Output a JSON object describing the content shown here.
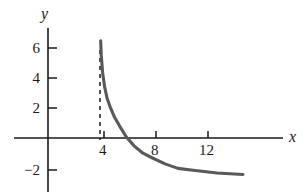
{
  "chart_data": {
    "type": "line",
    "title": "",
    "xlabel": "x",
    "ylabel": "y",
    "xlim": [
      -1,
      16.5
    ],
    "ylim": [
      -3.2,
      7.2
    ],
    "grid": false,
    "legend": null,
    "x_ticks": [
      {
        "value": 4,
        "label": "4"
      },
      {
        "value": 8,
        "label": "8"
      },
      {
        "value": 12,
        "label": "12"
      }
    ],
    "y_ticks": [
      {
        "value": 6,
        "label": "6"
      },
      {
        "value": 4,
        "label": "4"
      },
      {
        "value": 2,
        "label": "2"
      },
      {
        "value": -2,
        "label": "−2"
      }
    ],
    "annotations": [
      {
        "kind": "vertical-asymptote",
        "x": 4,
        "style": "dashed",
        "label": "x = 4"
      }
    ],
    "series": [
      {
        "name": "curve",
        "color": "#595959",
        "style": "solid",
        "x": [
          4.05,
          4.1,
          4.2,
          4.35,
          4.55,
          4.8,
          5.1,
          5.5,
          6.0,
          6.6,
          7.3,
          8.0,
          9.0,
          10.0,
          11.0,
          12.0,
          13.0,
          14.0,
          15.0
        ],
        "y": [
          6.4,
          5.4,
          4.3,
          3.4,
          2.6,
          2.0,
          1.4,
          0.8,
          0.1,
          -0.5,
          -1.0,
          -1.3,
          -1.7,
          -2.0,
          -2.1,
          -2.2,
          -2.3,
          -2.35,
          -2.4
        ]
      }
    ]
  },
  "axes": {
    "x_axis_name": "x",
    "y_axis_name": "y"
  }
}
